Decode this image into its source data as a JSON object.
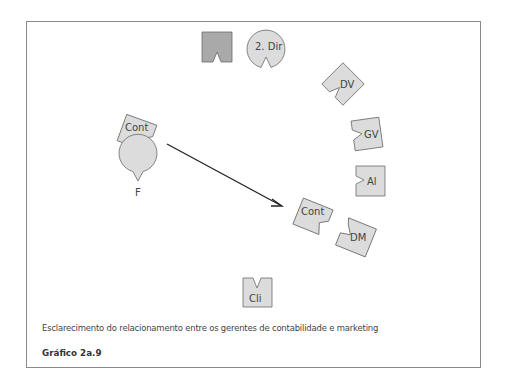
{
  "figure": {
    "caption": "Esclarecimento do relacionamento entre os gerentes de contabilidade e marketing",
    "number": "Gráfico 2a.9"
  },
  "colors": {
    "shape_fill": "#dcdcdc",
    "shape_fill_dark": "#a9a9a9",
    "shape_stroke": "#6a6a6a",
    "arrow": "#222222",
    "frame": "#8a8a8a"
  },
  "nodes": [
    {
      "id": "unlabeled-square",
      "label": "",
      "shape": "notched-square",
      "fill": "dark"
    },
    {
      "id": "2-dir",
      "label": "2. Dir",
      "shape": "notched-circle"
    },
    {
      "id": "dv",
      "label": "DV",
      "shape": "notched-square"
    },
    {
      "id": "cont-left",
      "label": "Cont",
      "shape": "notched-square"
    },
    {
      "id": "gv",
      "label": "GV",
      "shape": "notched-square"
    },
    {
      "id": "al",
      "label": "Al",
      "shape": "notched-square"
    },
    {
      "id": "f",
      "label": "F",
      "shape": "notched-circle"
    },
    {
      "id": "cont-right",
      "label": "Cont",
      "shape": "notched-square"
    },
    {
      "id": "dm",
      "label": "DM",
      "shape": "notched-square"
    },
    {
      "id": "cli",
      "label": "Cli",
      "shape": "notched-square"
    }
  ],
  "edges": [
    {
      "from": "cont-left",
      "to": "cont-right",
      "type": "arrow"
    }
  ]
}
